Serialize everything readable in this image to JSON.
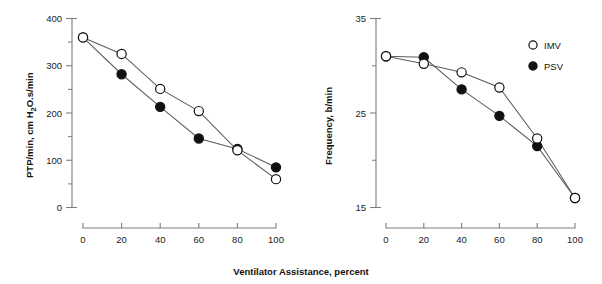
{
  "figure": {
    "shared_xlabel": "Ventilator Assistance, percent",
    "background": "#ffffff",
    "series_colors": {
      "imv": "#ffffff",
      "psv": "#111111",
      "line": "#5c5c5c",
      "axis": "#7d7d7d"
    }
  },
  "legend": {
    "position": "top-right of right panel",
    "entries": [
      {
        "label": "IMV",
        "marker": "open-circle"
      },
      {
        "label": "PSV",
        "marker": "filled-circle"
      }
    ]
  },
  "chart_data": [
    {
      "type": "line",
      "panel": "left",
      "title": "",
      "xlabel": "Ventilator Assistance, percent",
      "ylabel": "PTP/min, cm H2O.s/min",
      "ylabel_parts": {
        "pre": "PTP/min, cm H",
        "sub": "2",
        "post": "O.s/min"
      },
      "x": [
        0,
        20,
        40,
        60,
        80,
        100
      ],
      "xlim": [
        0,
        100
      ],
      "ylim": [
        0,
        400
      ],
      "xticks": [
        0,
        20,
        40,
        60,
        80,
        100
      ],
      "xticklabels": [
        "0",
        "20",
        "40",
        "60",
        "80",
        "100"
      ],
      "yticks": [
        0,
        100,
        200,
        300,
        400
      ],
      "yticklabels": [
        "0",
        "100",
        "200",
        "300",
        "400"
      ],
      "yminorticks": [
        50,
        150,
        250,
        350
      ],
      "grid": false,
      "series": [
        {
          "name": "IMV",
          "marker": "open-circle",
          "values": [
            360,
            325,
            251,
            204,
            121,
            60
          ]
        },
        {
          "name": "PSV",
          "marker": "filled-circle",
          "values": [
            360,
            282,
            213,
            146,
            124,
            85
          ]
        }
      ]
    },
    {
      "type": "line",
      "panel": "right",
      "title": "",
      "xlabel": "Ventilator Assistance, percent",
      "ylabel": "Frequency, b/min",
      "x": [
        0,
        20,
        40,
        60,
        80,
        100
      ],
      "xlim": [
        0,
        100
      ],
      "ylim": [
        15,
        35
      ],
      "xticks": [
        0,
        20,
        40,
        60,
        80,
        100
      ],
      "xticklabels": [
        "0",
        "20",
        "40",
        "60",
        "80",
        "100"
      ],
      "yticks": [
        15,
        25,
        35
      ],
      "yticklabels": [
        "15",
        "25",
        "35"
      ],
      "yminorticks": [
        20,
        30
      ],
      "grid": false,
      "series": [
        {
          "name": "IMV",
          "marker": "open-circle",
          "values": [
            31.0,
            30.2,
            29.3,
            27.7,
            22.3,
            16.0
          ]
        },
        {
          "name": "PSV",
          "marker": "filled-circle",
          "values": [
            31.0,
            30.9,
            27.5,
            24.7,
            21.5,
            16.0
          ]
        }
      ]
    }
  ]
}
